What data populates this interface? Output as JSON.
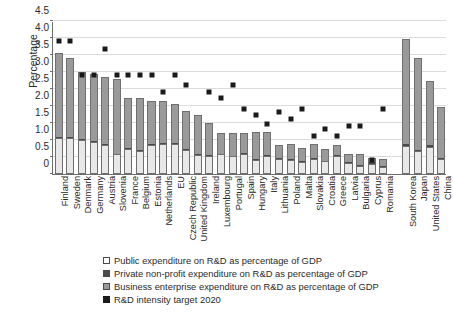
{
  "chart_data": {
    "type": "bar",
    "title": "",
    "xlabel": "",
    "ylabel": "Percentage",
    "ylim": [
      0,
      4.5
    ],
    "ytick_labels": [
      "0",
      "0.5",
      "1.0",
      "1.5",
      "2.0",
      "2.5",
      "3.0",
      "3.5",
      "4.0",
      "4.5"
    ],
    "ytick_values": [
      0,
      0.5,
      1.0,
      1.5,
      2.0,
      2.5,
      3.0,
      3.5,
      4.0,
      4.5
    ],
    "grid": true,
    "stacked": true,
    "legend_position": "bottom",
    "categories": [
      "Finland",
      "Sweden",
      "Denmark",
      "Germany",
      "Austria",
      "Slovenia",
      "France",
      "Belgium",
      "Estonia",
      "Netherlands",
      "EU",
      "Czech Republic",
      "United Kingdom",
      "Ireland",
      "Luxembourg",
      "Portugal",
      "Spain",
      "Hungary",
      "Italy",
      "Lithuania",
      "Poland",
      "Malta",
      "Slovakia",
      "Croatia",
      "Greece",
      "Latvia",
      "Bulgaria",
      "Cyprus",
      "Romania",
      "",
      "South Korea",
      "Japan",
      "United States",
      "China"
    ],
    "series": [
      {
        "name": "Public expenditure on R&D as percentage of GDP",
        "color": "#e8e8e8",
        "values": [
          1.06,
          1.07,
          1.01,
          0.95,
          0.86,
          0.58,
          0.74,
          0.67,
          0.86,
          0.88,
          0.88,
          0.72,
          0.56,
          0.54,
          0.58,
          0.52,
          0.59,
          0.43,
          0.54,
          0.45,
          0.42,
          0.34,
          0.45,
          0.38,
          0.52,
          0.32,
          0.24,
          0.3,
          0.22,
          null,
          0.82,
          0.68,
          0.8,
          0.44
        ]
      },
      {
        "name": "Private non-profit expenditure on R&D as percentage of GDP",
        "color": "#4a4a4a",
        "values": [
          0.02,
          0.02,
          0.03,
          0.02,
          0.02,
          0.01,
          0.03,
          0.02,
          0.01,
          0.02,
          0.02,
          0.01,
          0.04,
          0.02,
          0.01,
          0.02,
          0.01,
          0.01,
          0.01,
          0.01,
          0.01,
          0.03,
          0.01,
          0.01,
          0.03,
          0.02,
          0.01,
          0.04,
          0.02,
          null,
          0.05,
          0.03,
          0.04,
          0.01
        ]
      },
      {
        "name": "Business enterprise expenditure on R&D as percentage of GDP",
        "color": "#9a9a9a",
        "values": [
          2.47,
          2.31,
          1.96,
          1.96,
          1.96,
          2.21,
          1.48,
          1.55,
          1.28,
          1.25,
          1.15,
          1.12,
          1.13,
          0.93,
          0.61,
          0.66,
          0.62,
          0.81,
          0.68,
          0.4,
          0.45,
          0.4,
          0.43,
          0.36,
          0.29,
          0.26,
          0.35,
          0.14,
          0.19,
          null,
          3.1,
          2.69,
          1.91,
          1.53
        ]
      }
    ],
    "target_series": {
      "name": "R&D intensity target 2020",
      "color": "#1a1a1a",
      "values": [
        4.0,
        4.0,
        3.0,
        3.0,
        3.76,
        3.0,
        3.0,
        3.0,
        3.0,
        2.5,
        3.0,
        2.7,
        null,
        2.5,
        2.3,
        2.7,
        2.0,
        1.8,
        1.53,
        1.9,
        1.7,
        2.0,
        1.2,
        1.4,
        1.2,
        1.5,
        1.5,
        0.5,
        2.0,
        null,
        null,
        null,
        null,
        null
      ]
    }
  },
  "legend": {
    "items": [
      {
        "swatch": "public-swatch",
        "label": "Public expenditure on R&D as percentage of GDP"
      },
      {
        "swatch": "nonprofit-swatch",
        "label": "Private non-profit expenditure on R&D as percentage of GDP"
      },
      {
        "swatch": "business-swatch",
        "label": "Business enterprise expenditure on R&D as percentage of GDP"
      },
      {
        "swatch": "target-swatch",
        "label": "R&D intensity target 2020"
      }
    ]
  }
}
